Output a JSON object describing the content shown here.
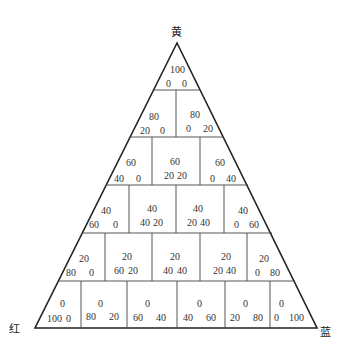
{
  "diagram": {
    "vertices": {
      "top": {
        "label": "黄",
        "meaning": "yellow"
      },
      "left": {
        "label": "红",
        "meaning": "red"
      },
      "right": {
        "label": "蓝",
        "meaning": "blue"
      }
    },
    "rows": [
      {
        "yellow": 100,
        "cells": [
          {
            "top": "100",
            "left": "0",
            "right": "0"
          }
        ]
      },
      {
        "yellow": 80,
        "cells": [
          {
            "top": "80",
            "left": "20",
            "right": "0"
          },
          {
            "top": "80",
            "left": "0",
            "right": "20"
          }
        ]
      },
      {
        "yellow": 60,
        "cells": [
          {
            "top": "60",
            "left": "40",
            "right": "0"
          },
          {
            "top": "60",
            "left": "20",
            "right": "20"
          },
          {
            "top": "60",
            "left": "0",
            "right": "40"
          }
        ]
      },
      {
        "yellow": 40,
        "cells": [
          {
            "top": "40",
            "left": "60",
            "right": "0"
          },
          {
            "top": "40",
            "left": "40",
            "right": "20"
          },
          {
            "top": "40",
            "left": "20",
            "right": "40"
          },
          {
            "top": "40",
            "left": "0",
            "right": "60"
          }
        ]
      },
      {
        "yellow": 20,
        "cells": [
          {
            "top": "20",
            "left": "80",
            "right": "0"
          },
          {
            "top": "20",
            "left": "60",
            "right": "20"
          },
          {
            "top": "20",
            "left": "40",
            "right": "40"
          },
          {
            "top": "20",
            "left": "20",
            "right": "40"
          },
          {
            "top": "20",
            "left": "0",
            "right": "80"
          }
        ]
      },
      {
        "yellow": 0,
        "cells": [
          {
            "top": "0",
            "left": "100",
            "right": "0"
          },
          {
            "top": "0",
            "left": "80",
            "right": "20"
          },
          {
            "top": "0",
            "left": "60",
            "right": "40"
          },
          {
            "top": "0",
            "left": "40",
            "right": "60"
          },
          {
            "top": "0",
            "left": "20",
            "right": "80"
          },
          {
            "top": "0",
            "left": "0",
            "right": "100"
          }
        ]
      }
    ]
  }
}
